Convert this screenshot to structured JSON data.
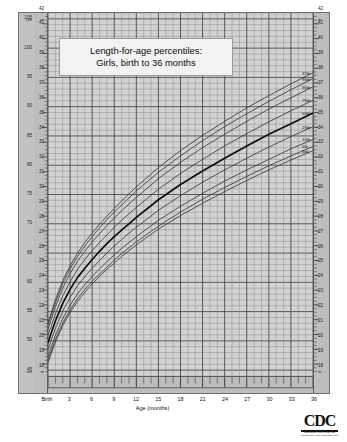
{
  "title": {
    "line1": "Length-for-age percentiles:",
    "line2": "Girls, birth to 36 months"
  },
  "axes": {
    "left_unit_top": "cm",
    "left_unit_bottom": "cm",
    "left_inch_unit_top": "in",
    "left_inch_unit_bottom": "in",
    "right_unit_top": "in",
    "right_unit_bottom": "in",
    "x_title": "Age (months)",
    "cm_ticks": [
      105,
      100,
      95,
      90,
      85,
      80,
      75,
      70,
      65,
      60,
      55,
      50,
      45
    ],
    "inch_ticks": [
      43,
      42,
      41,
      40,
      39,
      38,
      37,
      36,
      35,
      34,
      33,
      32,
      31,
      30,
      29,
      28,
      27,
      26,
      25,
      24,
      23,
      22,
      21,
      20,
      19,
      18,
      17,
      16
    ],
    "x_ticks": [
      "Birth",
      "3",
      "6",
      "9",
      "12",
      "15",
      "18",
      "21",
      "24",
      "27",
      "30",
      "33",
      "36"
    ]
  },
  "percentile_labels": [
    "97th",
    "95th",
    "90th",
    "75th",
    "50th",
    "25th",
    "10th",
    "5th",
    "3rd"
  ],
  "logo": {
    "mark": "CDC",
    "sub_line1": "CENTERS FOR DISEASE",
    "sub_line2": "CONTROL AND PREVENTION"
  },
  "colors": {
    "plot_background": "#d2d2d2",
    "gutter_background": "#bdbdbd",
    "grid_minor": "#8d8d8d",
    "grid_major": "#4a4a4a",
    "curve": "#3a3a3a",
    "curve_median": "#0d0d0d",
    "frame": "#6f6f6f",
    "title_box": "#f2f2f2"
  },
  "chart_data": {
    "type": "line",
    "title": "Length-for-age percentiles: Girls, birth to 36 months",
    "xlabel": "Age (months)",
    "ylabel": "Length (cm / in)",
    "xlim": [
      0,
      36
    ],
    "ylim": [
      44,
      106
    ],
    "y_secondary_label": "in",
    "y_secondary_lim": [
      16,
      43
    ],
    "grid": true,
    "legend": "inline-right-labels",
    "x": [
      0,
      1,
      2,
      3,
      4,
      5,
      6,
      7,
      8,
      9,
      10,
      11,
      12,
      15,
      18,
      21,
      24,
      27,
      30,
      33,
      36
    ],
    "series": [
      {
        "name": "97th",
        "values": [
          53.1,
          57.0,
          60.3,
          62.8,
          65.0,
          66.8,
          68.4,
          69.9,
          71.3,
          72.6,
          73.9,
          75.1,
          76.3,
          79.6,
          82.5,
          85.1,
          87.5,
          89.8,
          91.9,
          93.9,
          95.8
        ]
      },
      {
        "name": "95th",
        "values": [
          52.7,
          56.5,
          59.8,
          62.3,
          64.4,
          66.2,
          67.8,
          69.3,
          70.7,
          72.0,
          73.2,
          74.4,
          75.6,
          78.8,
          81.6,
          84.2,
          86.6,
          88.8,
          90.9,
          92.9,
          94.8
        ]
      },
      {
        "name": "90th",
        "values": [
          52.0,
          55.8,
          59.0,
          61.5,
          63.6,
          65.3,
          66.9,
          68.3,
          69.7,
          71.0,
          72.2,
          73.4,
          74.5,
          77.7,
          80.5,
          83.0,
          85.3,
          87.5,
          89.6,
          91.5,
          93.4
        ]
      },
      {
        "name": "75th",
        "values": [
          50.9,
          54.6,
          57.7,
          60.1,
          62.2,
          63.9,
          65.4,
          66.8,
          68.1,
          69.4,
          70.6,
          71.7,
          72.8,
          75.9,
          78.6,
          81.0,
          83.3,
          85.4,
          87.4,
          89.3,
          91.1
        ]
      },
      {
        "name": "50th",
        "values": [
          49.7,
          53.4,
          56.4,
          58.8,
          60.8,
          62.4,
          63.9,
          65.3,
          66.6,
          67.8,
          68.9,
          70.0,
          71.1,
          74.1,
          76.7,
          79.0,
          81.2,
          83.3,
          85.3,
          87.1,
          88.9
        ]
      },
      {
        "name": "25th",
        "values": [
          48.5,
          52.1,
          55.1,
          57.4,
          59.4,
          61.0,
          62.4,
          63.7,
          65.0,
          66.2,
          67.3,
          68.4,
          69.4,
          72.3,
          74.8,
          77.1,
          79.2,
          81.2,
          83.1,
          84.9,
          86.6
        ]
      },
      {
        "name": "10th",
        "values": [
          47.4,
          50.9,
          53.8,
          56.1,
          58.0,
          59.6,
          61.0,
          62.3,
          63.5,
          64.7,
          65.8,
          66.8,
          67.8,
          70.6,
          73.0,
          75.2,
          77.3,
          79.2,
          81.0,
          82.8,
          84.4
        ]
      },
      {
        "name": "5th",
        "values": [
          46.7,
          50.2,
          53.0,
          55.3,
          57.2,
          58.8,
          60.2,
          61.4,
          62.6,
          63.8,
          64.9,
          65.9,
          66.9,
          69.6,
          72.0,
          74.2,
          76.2,
          78.1,
          79.9,
          81.6,
          83.2
        ]
      },
      {
        "name": "3rd",
        "values": [
          46.3,
          49.8,
          52.6,
          54.9,
          56.7,
          58.3,
          59.7,
          61.0,
          62.2,
          63.3,
          64.4,
          65.4,
          66.4,
          69.1,
          71.4,
          73.5,
          75.5,
          77.4,
          79.2,
          80.9,
          82.5
        ]
      }
    ]
  }
}
